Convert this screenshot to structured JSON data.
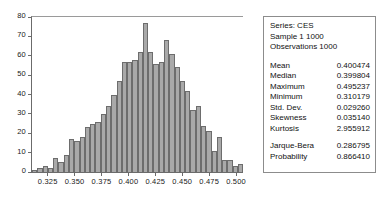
{
  "chart_data": {
    "type": "bar",
    "title": "",
    "subtitle": "",
    "xlabel": "",
    "ylabel": "",
    "grid": false,
    "legend": null,
    "xlim": [
      0.3095,
      0.5055
    ],
    "ylim": [
      0,
      80
    ],
    "y_ticks": [
      0,
      10,
      20,
      30,
      40,
      50,
      60,
      70,
      80
    ],
    "x_ticks": [
      0.325,
      0.35,
      0.375,
      0.4,
      0.425,
      0.45,
      0.475,
      0.5
    ],
    "x_tick_labels": [
      "0.325",
      "0.350",
      "0.375",
      "0.400",
      "0.425",
      "0.450",
      "0.475",
      "0.500"
    ],
    "y_tick_labels": [
      "0",
      "10",
      "20",
      "30",
      "40",
      "50",
      "60",
      "70",
      "80"
    ],
    "bin_count": 40,
    "bin_width": 0.0049,
    "bar_color": "#a9a9a9",
    "bar_edge_color": "#6d6d6d",
    "categories": [
      "0.3095",
      "0.3144",
      "0.3193",
      "0.3242",
      "0.3291",
      "0.3340",
      "0.3389",
      "0.3438",
      "0.3487",
      "0.3536",
      "0.3585",
      "0.3634",
      "0.3683",
      "0.3732",
      "0.3781",
      "0.3830",
      "0.3879",
      "0.3928",
      "0.3977",
      "0.4026",
      "0.4075",
      "0.4124",
      "0.4173",
      "0.4222",
      "0.4271",
      "0.4320",
      "0.4369",
      "0.4418",
      "0.4467",
      "0.4516",
      "0.4565",
      "0.4614",
      "0.4663",
      "0.4712",
      "0.4761",
      "0.4810",
      "0.4859",
      "0.4908",
      "0.4957",
      "0.5006"
    ],
    "values": [
      1,
      2,
      3,
      2,
      7,
      5,
      9,
      17,
      16,
      18,
      23,
      25,
      26,
      30,
      34,
      40,
      47,
      57,
      57,
      58,
      62,
      77,
      62,
      56,
      57,
      68,
      61,
      54,
      47,
      42,
      32,
      34,
      24,
      21,
      11,
      18,
      6,
      6,
      3,
      4
    ]
  },
  "stats": {
    "header": [
      "Series: CES",
      "Sample 1 1000",
      "Observations 1000"
    ],
    "rows": [
      {
        "label": "Mean",
        "value": "0.400474"
      },
      {
        "label": "Median",
        "value": "0.399804"
      },
      {
        "label": "Maximum",
        "value": "0.495237"
      },
      {
        "label": "Minimum",
        "value": "0.310179"
      },
      {
        "label": "Std. Dev.",
        "value": "0.029260"
      },
      {
        "label": "Skewness",
        "value": "0.035140"
      },
      {
        "label": "Kurtosis",
        "value": "2.955912"
      }
    ],
    "test_rows": [
      {
        "label": "Jarque-Bera",
        "value": "0.286795"
      },
      {
        "label": "Probability",
        "value": "0.866410"
      }
    ]
  }
}
